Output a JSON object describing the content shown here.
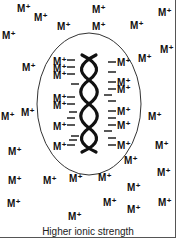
{
  "diagram": {
    "caption": "Higher ionic strength",
    "ion_label": "M",
    "ion_charge": "+",
    "colors": {
      "ink": "#111111",
      "frame": "#555555",
      "background": "#ffffff"
    },
    "shapes": [
      {
        "type": "ellipse",
        "role": "ion-atmosphere-boundary"
      },
      {
        "type": "double-helix",
        "role": "dna-molecule"
      },
      {
        "type": "dash",
        "role": "phosphate-negative-charge",
        "count_left": 12,
        "count_right": 12
      }
    ],
    "free_ions": [
      {
        "x": 17,
        "y": 4
      },
      {
        "x": 34,
        "y": 13
      },
      {
        "x": 57,
        "y": 22
      },
      {
        "x": 2,
        "y": 31
      },
      {
        "x": 92,
        "y": 5
      },
      {
        "x": 158,
        "y": 8
      },
      {
        "x": 92,
        "y": 22
      },
      {
        "x": 130,
        "y": 21
      },
      {
        "x": 22,
        "y": 63
      },
      {
        "x": 160,
        "y": 45
      },
      {
        "x": 138,
        "y": 54
      },
      {
        "x": 1,
        "y": 112
      },
      {
        "x": 21,
        "y": 108
      },
      {
        "x": 148,
        "y": 112
      },
      {
        "x": 8,
        "y": 147
      },
      {
        "x": 155,
        "y": 141
      },
      {
        "x": 124,
        "y": 156
      },
      {
        "x": 8,
        "y": 176
      },
      {
        "x": 43,
        "y": 176
      },
      {
        "x": 69,
        "y": 174
      },
      {
        "x": 98,
        "y": 173
      },
      {
        "x": 127,
        "y": 183
      },
      {
        "x": 157,
        "y": 168
      },
      {
        "x": 7,
        "y": 199
      },
      {
        "x": 103,
        "y": 198
      },
      {
        "x": 127,
        "y": 205
      },
      {
        "x": 158,
        "y": 198
      },
      {
        "x": 68,
        "y": 212
      }
    ],
    "bound_ions_left": [
      {
        "x": 53,
        "y": 57
      },
      {
        "x": 53,
        "y": 64
      },
      {
        "x": 53,
        "y": 71
      },
      {
        "x": 53,
        "y": 94
      },
      {
        "x": 53,
        "y": 101
      },
      {
        "x": 53,
        "y": 122
      },
      {
        "x": 53,
        "y": 142
      }
    ],
    "bound_ions_right": [
      {
        "x": 117,
        "y": 58
      },
      {
        "x": 117,
        "y": 78
      },
      {
        "x": 117,
        "y": 85
      },
      {
        "x": 117,
        "y": 107
      },
      {
        "x": 117,
        "y": 121
      },
      {
        "x": 117,
        "y": 141
      }
    ]
  }
}
